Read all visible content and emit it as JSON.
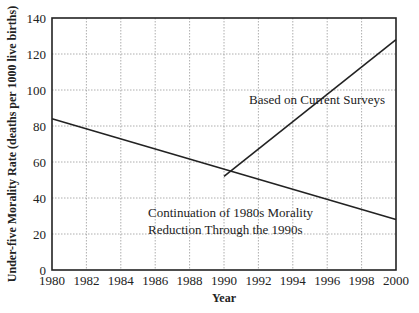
{
  "chart_data": {
    "type": "line",
    "title": "",
    "xlabel": "Year",
    "ylabel": "Under-five Morality Rate (deaths per 1000 live births)",
    "xlim": [
      1980,
      2000
    ],
    "ylim": [
      0,
      140
    ],
    "x_ticks": [
      1980,
      1982,
      1984,
      1986,
      1988,
      1990,
      1992,
      1994,
      1996,
      1998,
      2000
    ],
    "y_ticks": [
      0,
      20,
      40,
      60,
      80,
      100,
      120,
      140
    ],
    "grid": true,
    "legend": null,
    "series": [
      {
        "name": "Continuation of 1980s Morality Reduction Through the 1990s",
        "x": [
          1980,
          2000
        ],
        "values": [
          84,
          28
        ]
      },
      {
        "name": "Based on Current Surveys",
        "x": [
          1990,
          2000
        ],
        "values": [
          52,
          128
        ]
      }
    ],
    "annotations": [
      {
        "text": "Based on Current Surveys",
        "x": 1994.3,
        "y": 92
      },
      {
        "text": "Continuation of 1980s Morality",
        "x": 1990.7,
        "y": 31
      },
      {
        "text": "Reduction Through the 1990s",
        "x": 1990.7,
        "y": 21
      }
    ]
  },
  "labels": {
    "xlabel": "Year",
    "ylabel": "Under-five Morality Rate (deaths per 1000 live births)",
    "annot1": "Based on Current Surveys",
    "annot2a": "Continuation of 1980s Morality",
    "annot2b": "Reduction Through the 1990s"
  }
}
